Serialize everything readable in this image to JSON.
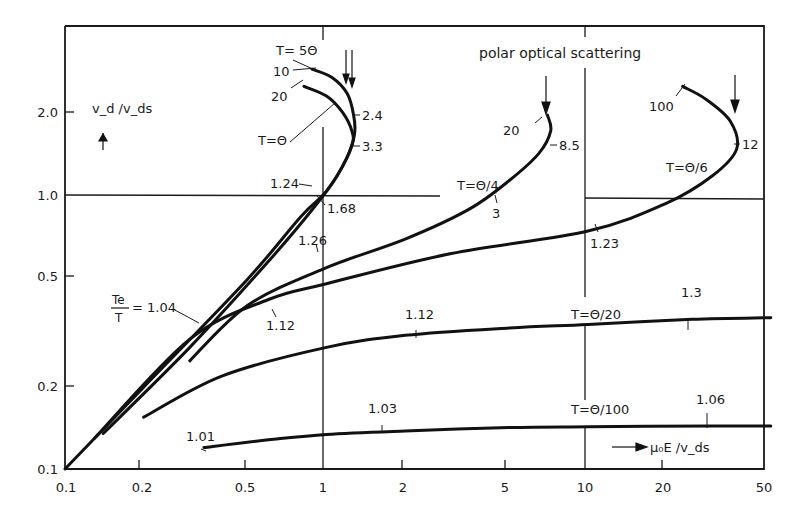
{
  "chart_data": {
    "type": "line",
    "title": "",
    "xlabel": "μ₀E / v_ds",
    "ylabel": "v_d / v_ds",
    "xscale": "log",
    "yscale": "log",
    "xlim": [
      0.1,
      50
    ],
    "ylim": [
      0.1,
      3.0
    ],
    "grid": "partial (x=1, x=10, y=1.0 reference lines)",
    "legend": "none (curves labelled inline)",
    "annotation_title": "polar optical scattering",
    "x_ticks": [
      "0.1",
      "0.2",
      "0.5",
      "1",
      "2",
      "5",
      "10",
      "20",
      "50"
    ],
    "y_ticks": [
      "0.1",
      "0.2",
      "0.5",
      "1.0",
      "2.0"
    ],
    "series": [
      {
        "name": "T = 5Θ",
        "label_extra": "10",
        "points": [
          [
            0.1,
            0.1
          ],
          [
            0.2,
            0.2
          ],
          [
            0.5,
            0.5
          ],
          [
            0.8,
            0.85
          ],
          [
            1.0,
            1.05
          ],
          [
            1.2,
            1.4
          ],
          [
            1.28,
            1.7
          ],
          [
            1.27,
            2.0
          ],
          [
            1.2,
            2.4
          ],
          [
            1.05,
            2.75
          ],
          [
            0.88,
            2.95
          ]
        ],
        "Te_over_T_annotations": [
          {
            "x": 1.0,
            "y": 1.0,
            "value": "1.24"
          },
          {
            "x": 1.28,
            "y": 1.9,
            "value": "2.4"
          }
        ]
      },
      {
        "name": "T = Θ",
        "label_extra": "20",
        "points": [
          [
            0.14,
            0.135
          ],
          [
            0.3,
            0.28
          ],
          [
            0.6,
            0.58
          ],
          [
            0.9,
            0.92
          ],
          [
            1.1,
            1.2
          ],
          [
            1.25,
            1.55
          ],
          [
            1.25,
            1.75
          ],
          [
            1.15,
            2.05
          ],
          [
            1.0,
            2.35
          ],
          [
            0.82,
            2.55
          ]
        ],
        "Te_over_T_annotations": [
          {
            "x": 1.05,
            "y": 1.0,
            "value": "1.68"
          },
          {
            "x": 1.26,
            "y": 1.6,
            "value": "3.3"
          }
        ]
      },
      {
        "name": "T = Θ/4",
        "label_extra": "20",
        "points": [
          [
            0.3,
            0.25
          ],
          [
            0.5,
            0.4
          ],
          [
            1.0,
            0.55
          ],
          [
            2.0,
            0.7
          ],
          [
            3.5,
            0.9
          ],
          [
            5.0,
            1.15
          ],
          [
            6.5,
            1.45
          ],
          [
            7.2,
            1.75
          ],
          [
            7.0,
            2.0
          ]
        ],
        "Te_over_T_annotations": [
          {
            "x": 1.0,
            "y": 0.55,
            "value": "1.26"
          },
          {
            "x": 3.2,
            "y": 0.88,
            "value": "3"
          },
          {
            "x": 7.2,
            "y": 1.6,
            "value": "8.5"
          }
        ]
      },
      {
        "name": "T = Θ/6",
        "label_extra": "100",
        "points": [
          [
            0.13,
            0.13
          ],
          [
            0.3,
            0.3
          ],
          [
            0.6,
            0.42
          ],
          [
            1.0,
            0.48
          ],
          [
            3.0,
            0.62
          ],
          [
            10.0,
            0.75
          ],
          [
            20.0,
            0.95
          ],
          [
            30.0,
            1.2
          ],
          [
            37.0,
            1.5
          ],
          [
            35.0,
            1.9
          ],
          [
            28.0,
            2.3
          ],
          [
            23.0,
            2.55
          ]
        ],
        "Te_over_T_annotations": [
          {
            "x": 0.7,
            "y": 0.42,
            "value": "1.12"
          },
          {
            "x": 10.0,
            "y": 0.75,
            "value": "1.23"
          },
          {
            "x": 37.0,
            "y": 1.6,
            "value": "12"
          }
        ]
      },
      {
        "name": "T = Θ/20",
        "points": [
          [
            0.2,
            0.155
          ],
          [
            0.4,
            0.22
          ],
          [
            1.0,
            0.28
          ],
          [
            2.0,
            0.31
          ],
          [
            5.0,
            0.33
          ],
          [
            10.0,
            0.34
          ],
          [
            25.0,
            0.355
          ],
          [
            50.0,
            0.36
          ]
        ],
        "Te_over_T_annotations": [
          {
            "x": 2.2,
            "y": 0.31,
            "value": "1.12"
          },
          {
            "x": 24.0,
            "y": 0.355,
            "value": "1.3"
          }
        ]
      },
      {
        "name": "T = Θ/100",
        "points": [
          [
            0.34,
            0.12
          ],
          [
            0.6,
            0.128
          ],
          [
            1.0,
            0.134
          ],
          [
            2.0,
            0.138
          ],
          [
            5.0,
            0.142
          ],
          [
            10.0,
            0.143
          ],
          [
            30.0,
            0.144
          ],
          [
            50.0,
            0.144
          ]
        ],
        "Te_over_T_annotations": [
          {
            "x": 2.3,
            "y": 0.14,
            "value": "1.03"
          },
          {
            "x": 30.0,
            "y": 0.144,
            "value": "1.06"
          },
          {
            "x": 0.34,
            "y": 0.12,
            "value": "1.01"
          }
        ]
      }
    ],
    "annotations": [
      {
        "text": "T = 5Θ"
      },
      {
        "text": "10"
      },
      {
        "text": "20"
      },
      {
        "text": "T = Θ"
      },
      {
        "text": "2.4"
      },
      {
        "text": "3.3"
      },
      {
        "text": "1.24"
      },
      {
        "text": "1.68"
      },
      {
        "text": "1.26"
      },
      {
        "text": "Te/T = 1.04"
      },
      {
        "text": "1.12"
      },
      {
        "text": "20"
      },
      {
        "text": "8.5"
      },
      {
        "text": "T = Θ/4"
      },
      {
        "text": "3"
      },
      {
        "text": "100"
      },
      {
        "text": "12"
      },
      {
        "text": "T = Θ/6"
      },
      {
        "text": "1.23"
      },
      {
        "text": "1.12"
      },
      {
        "text": "T = Θ/20"
      },
      {
        "text": "1.3"
      },
      {
        "text": "1.01"
      },
      {
        "text": "1.03"
      },
      {
        "text": "T = Θ/100"
      },
      {
        "text": "1.06"
      },
      {
        "text": "polar optical scattering"
      }
    ]
  },
  "labels": {
    "title": "polar optical scattering",
    "y_axis": "v_d /v_ds",
    "x_axis": "μ₀E /v_ds",
    "te_ratio_num": "Te",
    "te_ratio_den": "T",
    "te_ratio_val": "= 1.04",
    "t5": "T= 5Θ",
    "t1": "T=Θ",
    "t4": "T=Θ/4",
    "t6": "T=Θ/6",
    "t20": "T=Θ/20",
    "t100": "T=Θ/100",
    "n10": "10",
    "n20a": "20",
    "n24": "2.4",
    "n33": "3.3",
    "n124": "1.24",
    "n168": "1.68",
    "n126": "1.26",
    "n112a": "1.12",
    "n20b": "20",
    "n85": "8.5",
    "n3": "3",
    "n100": "100",
    "n12": "12",
    "n123": "1.23",
    "n112b": "1.12",
    "n13": "1.3",
    "n101": "1.01",
    "n103": "1.03",
    "n106": "1.06"
  }
}
